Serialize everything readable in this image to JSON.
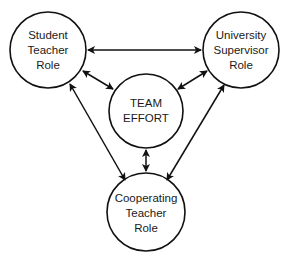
{
  "diagram": {
    "nodes": [
      {
        "id": "student",
        "lines": [
          "Student",
          "Teacher",
          "Role"
        ],
        "cx": 48,
        "cy": 50,
        "r": 38
      },
      {
        "id": "university",
        "lines": [
          "University",
          "Supervisor",
          "Role"
        ],
        "cx": 241,
        "cy": 50,
        "r": 38
      },
      {
        "id": "team",
        "lines": [
          "TEAM",
          "EFFORT"
        ],
        "cx": 146,
        "cy": 111,
        "r": 37
      },
      {
        "id": "cooperating",
        "lines": [
          "Cooperating",
          "Teacher",
          "Role"
        ],
        "cx": 146,
        "cy": 212,
        "r": 39
      }
    ],
    "edges": [
      {
        "from": "student",
        "to": "university",
        "direction": "both"
      },
      {
        "from": "student",
        "to": "team",
        "direction": "both"
      },
      {
        "from": "university",
        "to": "team",
        "direction": "both"
      },
      {
        "from": "team",
        "to": "cooperating",
        "direction": "both"
      },
      {
        "from": "student",
        "to": "cooperating",
        "direction": "both"
      },
      {
        "from": "university",
        "to": "cooperating",
        "direction": "both"
      }
    ],
    "stroke_color": "#111111"
  }
}
